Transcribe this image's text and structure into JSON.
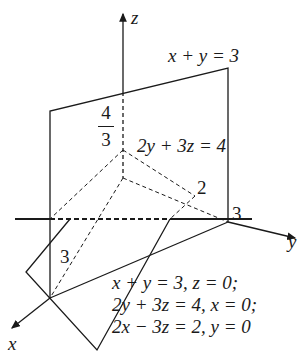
{
  "figure": {
    "axes": {
      "x_label": "x",
      "y_label": "y",
      "z_label": "z"
    },
    "plane_labels": {
      "plane1": "x + y = 3",
      "plane2": "2y + 3z = 4"
    },
    "tick_labels": {
      "z_intercept_num": "4",
      "z_intercept_den": "3",
      "x_intercept": "3",
      "y_intercept": "3",
      "y_mark_2": "2"
    },
    "equations": [
      "x + y = 3, z = 0;",
      "2y + 3z = 4, x = 0;",
      "2x − 3z = 2, y = 0"
    ],
    "colors": {
      "line": "#1a1a1a",
      "background": "#ffffff"
    }
  }
}
